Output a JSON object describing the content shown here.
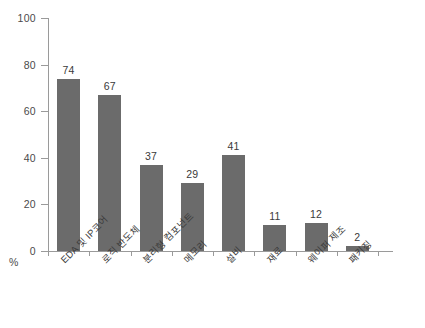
{
  "chart_data": {
    "type": "bar",
    "title": "",
    "xlabel": "",
    "ylabel": "%",
    "ylim": [
      0,
      100
    ],
    "yticks": [
      0,
      20,
      40,
      60,
      80,
      100
    ],
    "grid": false,
    "legend": null,
    "bar_color": "#6b6b6b",
    "axis_color": "#9a9a9a",
    "categories": [
      "EDA 및 IP코어",
      "로직 반도체",
      "분리형 컴포넌트",
      "메모리",
      "설비",
      "재료",
      "웨이퍼 제조",
      "패키징"
    ],
    "values": [
      74,
      67,
      37,
      29,
      41,
      11,
      12,
      2
    ],
    "value_labels": [
      "74",
      "67",
      "37",
      "29",
      "41",
      "11",
      "12",
      "2"
    ]
  },
  "axis": {
    "y_unit_label": "%",
    "y_tick_labels": [
      "100",
      "80",
      "60",
      "40",
      "20",
      "0"
    ]
  }
}
